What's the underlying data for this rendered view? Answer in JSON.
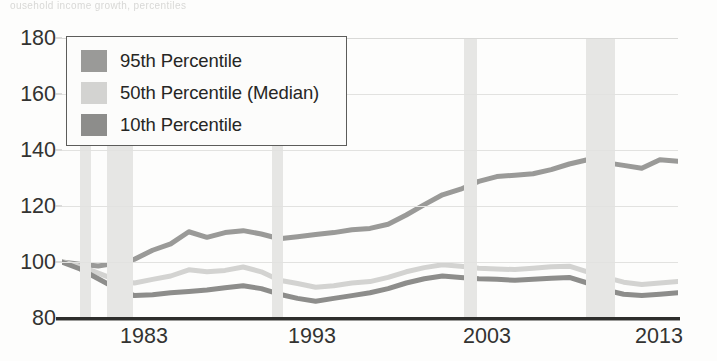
{
  "top_clipped_text": "ousehold income growth, percentiles",
  "legend": {
    "position": "top-left-inside",
    "items": [
      {
        "label": "95th Percentile",
        "color": "#9a9a98"
      },
      {
        "label": "50th Percentile (Median)",
        "color": "#d3d3d1"
      },
      {
        "label": "10th Percentile",
        "color": "#8d8d8b"
      }
    ]
  },
  "axes": {
    "y_ticks": [
      "180",
      "160",
      "140",
      "120",
      "100",
      "80"
    ],
    "x_ticks": [
      "1983",
      "1993",
      "2003",
      "2013"
    ]
  },
  "colors": {
    "recession_band": "#e6e6e4",
    "gridline": "#e2e2e0",
    "axis_line": "#2e2e2c",
    "tick_text": "#333331"
  },
  "chart_data": {
    "type": "line",
    "title": "",
    "subtitle": "",
    "xlabel": "",
    "ylabel": "",
    "xlim": [
      1979,
      2013
    ],
    "ylim": [
      80,
      180
    ],
    "y_ticks": [
      80,
      100,
      120,
      140,
      160,
      180
    ],
    "x_ticks": [
      1983,
      1993,
      2003,
      2013
    ],
    "grid": true,
    "legend_position": "upper-left",
    "x": [
      1979,
      1980,
      1981,
      1982,
      1983,
      1984,
      1985,
      1986,
      1987,
      1988,
      1989,
      1990,
      1991,
      1992,
      1993,
      1994,
      1995,
      1996,
      1997,
      1998,
      1999,
      2000,
      2001,
      2002,
      2003,
      2004,
      2005,
      2006,
      2007,
      2008,
      2009,
      2010,
      2011,
      2012,
      2013
    ],
    "series": [
      {
        "name": "95th Percentile",
        "color": "#9a9a98",
        "values": [
          100.0,
          99.2,
          98.6,
          99.6,
          101.0,
          104.2,
          106.5,
          110.8,
          108.8,
          110.5,
          111.2,
          110.0,
          108.3,
          109.0,
          109.8,
          110.5,
          111.5,
          112.0,
          113.5,
          116.8,
          120.5,
          124.0,
          126.0,
          128.8,
          130.5,
          131.0,
          131.5,
          133.0,
          135.0,
          136.5,
          135.5,
          134.5,
          133.5,
          136.5,
          136.0
        ]
      },
      {
        "name": "50th Percentile (Median)",
        "color": "#d3d3d1",
        "values": [
          100.0,
          98.5,
          96.0,
          93.5,
          92.5,
          93.8,
          95.0,
          97.2,
          96.5,
          97.0,
          98.2,
          96.5,
          93.5,
          92.3,
          91.0,
          91.5,
          92.5,
          93.0,
          94.5,
          96.5,
          98.0,
          99.0,
          98.5,
          97.8,
          97.5,
          97.3,
          97.8,
          98.3,
          98.5,
          96.5,
          94.5,
          92.8,
          92.0,
          92.5,
          93.0
        ]
      },
      {
        "name": "10th Percentile",
        "color": "#8d8d8b",
        "values": [
          100.0,
          97.5,
          94.0,
          90.5,
          88.0,
          88.3,
          89.0,
          89.5,
          90.0,
          90.8,
          91.5,
          90.5,
          88.5,
          87.0,
          86.0,
          87.0,
          88.0,
          89.0,
          90.5,
          92.5,
          94.0,
          95.0,
          94.5,
          94.0,
          93.8,
          93.5,
          93.8,
          94.2,
          94.5,
          92.5,
          90.0,
          88.5,
          88.0,
          88.5,
          89.0
        ]
      }
    ],
    "recession_bands": [
      {
        "start": 1980.0,
        "end": 1980.6
      },
      {
        "start": 1981.5,
        "end": 1982.9
      },
      {
        "start": 1990.6,
        "end": 1991.2
      },
      {
        "start": 2001.2,
        "end": 2001.9
      },
      {
        "start": 2007.9,
        "end": 2009.5
      }
    ]
  }
}
